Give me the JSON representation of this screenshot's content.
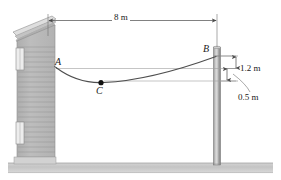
{
  "figure": {
    "type": "engineering-statics-diagram",
    "colors": {
      "line": "#555555",
      "cable": "#4a4a4a",
      "ground": "#c9c9c9",
      "ground_edge": "#9a9a9a",
      "siding": "#b9b9b9",
      "siding_line": "#8e8e8e",
      "roof": "#d6d6d6",
      "pole_light": "#d8d8d8",
      "pole_dark": "#8a8a8a",
      "text": "#1a1a1a",
      "background": "#ffffff"
    },
    "points": {
      "A": {
        "label": "A",
        "desc": "cable attachment on house wall"
      },
      "B": {
        "label": "B",
        "desc": "cable attachment on pole"
      },
      "C": {
        "label": "C",
        "desc": "lowest point of sagging cable"
      }
    },
    "dimensions": {
      "span": {
        "label": "8 m",
        "value": 8,
        "unit": "m",
        "orientation": "horizontal",
        "between": [
          "house-wall",
          "pole"
        ]
      },
      "drop_b_to_a": {
        "label": "1.2 m",
        "value": 1.2,
        "unit": "m",
        "orientation": "vertical",
        "between": [
          "B",
          "A-level"
        ]
      },
      "drop_a_to_c": {
        "label": "0.5 m",
        "value": 0.5,
        "unit": "m",
        "orientation": "vertical",
        "between": [
          "A-level",
          "C-level"
        ]
      }
    },
    "objects": {
      "house": {
        "name": "house",
        "desc": "sided house wall with sloped roof and two windows"
      },
      "pole": {
        "name": "utility-pole",
        "desc": "vertical cylindrical pole on right"
      },
      "ground": {
        "name": "ground",
        "desc": "horizontal ground strip"
      },
      "cable": {
        "name": "cable",
        "desc": "catenary cable from A through C to B"
      }
    }
  }
}
